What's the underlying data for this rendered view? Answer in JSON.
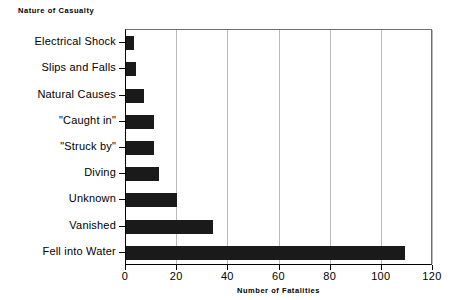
{
  "chart_data": {
    "type": "bar",
    "orientation": "horizontal",
    "title": "",
    "ylabel": "Nature of Casualty",
    "xlabel": "Number of Fatalities",
    "categories": [
      "Electrical Shock",
      "Slips and Falls",
      "Natural Causes",
      "\"Caught in\"",
      "\"Struck by\"",
      "Diving",
      "Unknown",
      "Vanished",
      "Fell into Water"
    ],
    "values": [
      3,
      4,
      7,
      11,
      11,
      13,
      20,
      34,
      109
    ],
    "xlim": [
      0,
      120
    ],
    "xticks": [
      0,
      20,
      40,
      60,
      80,
      100,
      120
    ],
    "xtick_labels": [
      "0",
      "20",
      "40",
      "60",
      "80",
      "100",
      "120"
    ],
    "grid": "vertical",
    "legend": "none",
    "bar_color": "#1a1a1a"
  }
}
